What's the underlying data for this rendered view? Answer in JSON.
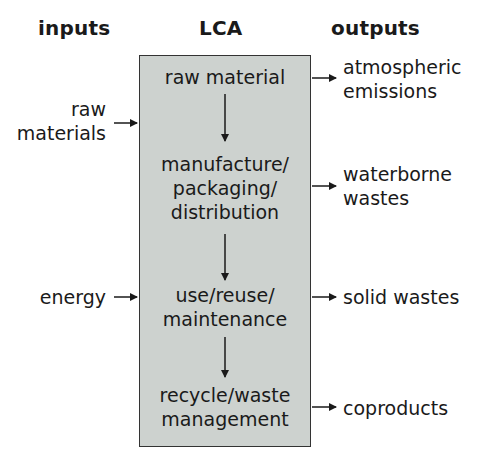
{
  "headers": {
    "inputs": "inputs",
    "lca": "LCA",
    "outputs": "outputs"
  },
  "stages": [
    {
      "line1": "raw material",
      "line2": "",
      "line3": ""
    },
    {
      "line1": "manufacture/",
      "line2": "packaging/",
      "line3": "distribution"
    },
    {
      "line1": "use/reuse/",
      "line2": "maintenance",
      "line3": ""
    },
    {
      "line1": "recycle/waste",
      "line2": "management",
      "line3": ""
    }
  ],
  "inputs": [
    {
      "line1": "raw",
      "line2": "materials"
    },
    {
      "line1": "energy",
      "line2": ""
    }
  ],
  "outputs": [
    {
      "line1": "atmospheric",
      "line2": "emissions"
    },
    {
      "line1": "waterborne",
      "line2": "wastes"
    },
    {
      "line1": "solid wastes",
      "line2": ""
    },
    {
      "line1": "coproducts",
      "line2": ""
    }
  ],
  "colors": {
    "box_fill": "#cdd2cf",
    "stroke": "#1a1a1a"
  }
}
